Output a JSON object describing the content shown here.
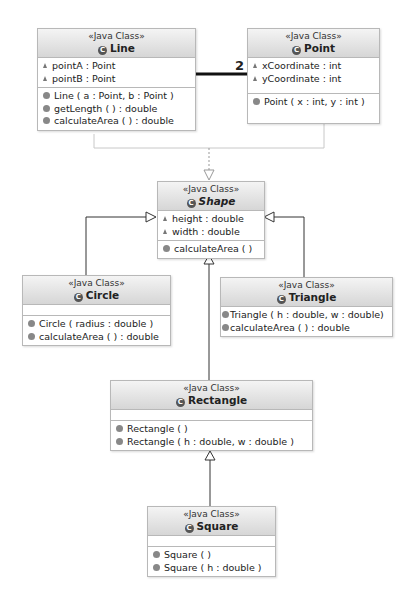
{
  "diagram": {
    "stereotype": "«Java Class»",
    "association": {
      "from": "Line",
      "to": "Point",
      "multiplicity": "2"
    },
    "classes": {
      "line": {
        "name": "Line",
        "fields": [
          "pointA : Point",
          "pointB : Point"
        ],
        "methods": [
          "Line ( a : Point, b : Point )",
          "getLength ( ) : double",
          "calculateArea ( ) : double"
        ]
      },
      "point": {
        "name": "Point",
        "fields": [
          "xCoordinate : int",
          "yCoordinate : int"
        ],
        "methods": [
          "Point ( x : int, y : int )"
        ]
      },
      "shape": {
        "name": "Shape",
        "abstract": true,
        "fields": [
          "height : double",
          "width : double"
        ],
        "methods": [
          "calculateArea ( )"
        ]
      },
      "circle": {
        "name": "Circle",
        "fields": [],
        "methods": [
          "Circle ( radius : double )",
          "calculateArea ( ) : double"
        ]
      },
      "triangle": {
        "name": "Triangle",
        "methods": [
          "Triangle ( h : double, w : double)",
          "calculateArea ( ) : double"
        ]
      },
      "rectangle": {
        "name": "Rectangle",
        "fields": [],
        "methods": [
          "Rectangle ( )",
          "Rectangle ( h : double, w : double )"
        ]
      },
      "square": {
        "name": "Square",
        "fields": [],
        "methods": [
          "Square ( )",
          "Square ( h : double )"
        ]
      }
    },
    "icons": {
      "class": "class-c-icon",
      "field": "package-field-triangle-icon",
      "method": "public-method-dot-icon"
    }
  }
}
